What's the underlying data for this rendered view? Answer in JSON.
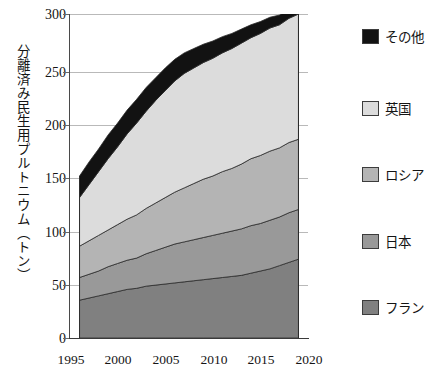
{
  "chart_data": {
    "type": "area",
    "stacked": true,
    "title": "",
    "xlabel": "",
    "ylabel": "分離済み民生用プルトニウム（トン）",
    "xlim": [
      1995,
      2020
    ],
    "ylim": [
      0,
      300
    ],
    "grid": true,
    "legend_position": "right",
    "x_ticks": [
      "1995",
      "2000",
      "2005",
      "2010",
      "2015",
      "2020"
    ],
    "y_ticks": [
      "0",
      "50",
      "100",
      "150",
      "200",
      "250",
      "300"
    ],
    "x": [
      1996,
      1997,
      1998,
      1999,
      2000,
      2001,
      2002,
      2003,
      2004,
      2005,
      2006,
      2007,
      2008,
      2009,
      2010,
      2011,
      2012,
      2013,
      2014,
      2015,
      2016,
      2017,
      2018,
      2019
    ],
    "series": [
      {
        "name": "フランス",
        "color": "#808080",
        "values": [
          35,
          37,
          39,
          41,
          43,
          45,
          46,
          48,
          49,
          50,
          51,
          52,
          53,
          54,
          55,
          56,
          57,
          58,
          60,
          62,
          64,
          67,
          70,
          73
        ]
      },
      {
        "name": "日本",
        "color": "#999999",
        "values": [
          21,
          22,
          23,
          25,
          26,
          27,
          28,
          30,
          32,
          34,
          36,
          37,
          38,
          39,
          40,
          41,
          42,
          43,
          44,
          44,
          45,
          45,
          46,
          46
        ]
      },
      {
        "name": "ロシア",
        "color": "#b4b4b4",
        "values": [
          29,
          31,
          33,
          34,
          36,
          38,
          40,
          42,
          44,
          46,
          48,
          50,
          52,
          54,
          55,
          57,
          58,
          60,
          62,
          63,
          64,
          64,
          65,
          65
        ]
      },
      {
        "name": "英国",
        "color": "#dcdcdc",
        "values": [
          45,
          52,
          59,
          66,
          72,
          79,
          85,
          90,
          95,
          99,
          103,
          106,
          107,
          108,
          109,
          110,
          111,
          112,
          112,
          113,
          114,
          114,
          115,
          116
        ]
      },
      {
        "name": "その他",
        "color": "#121212",
        "values": [
          20,
          21,
          21,
          22,
          22,
          22,
          22,
          22,
          21,
          21,
          20,
          19,
          18,
          17,
          16,
          15,
          14,
          13,
          12,
          11,
          10,
          9,
          8,
          7
        ]
      }
    ],
    "totals": [
      150,
      163,
      175,
      188,
      199,
      211,
      221,
      232,
      241,
      250,
      258,
      264,
      268,
      272,
      275,
      279,
      282,
      286,
      290,
      293,
      297,
      299,
      304,
      307
    ]
  },
  "legend": {
    "items": [
      {
        "label": "その他",
        "color": "#121212"
      },
      {
        "label": "英国",
        "color": "#dcdcdc"
      },
      {
        "label": "ロシア",
        "color": "#b4b4b4"
      },
      {
        "label": "日本",
        "color": "#999999"
      },
      {
        "label": "フラン",
        "color": "#808080"
      }
    ]
  },
  "axes": {
    "y_title": "分離済み民生用プルトニウム（トン）",
    "y_ticks": [
      "300",
      "250",
      "200",
      "150",
      "100",
      "50",
      "0"
    ],
    "x_ticks": [
      "1995",
      "2000",
      "2005",
      "2010",
      "2015",
      "2020"
    ]
  }
}
